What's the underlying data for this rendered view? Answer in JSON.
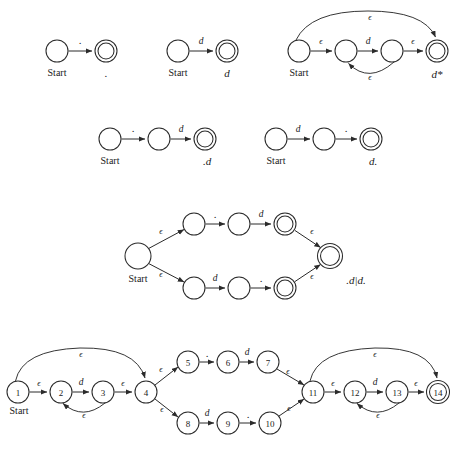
{
  "figure": {
    "start_label": "Start",
    "epsilon": "ϵ",
    "symbols": {
      "dot": ".",
      "digit": "d"
    }
  },
  "diagrams": [
    {
      "id": "nfa-dot",
      "caption": ".",
      "start_label": "Start",
      "states": [
        {
          "name": "q0",
          "accepting": false,
          "label": ""
        },
        {
          "name": "q1",
          "accepting": true,
          "label": ""
        }
      ],
      "transitions": [
        {
          "from": "q0",
          "to": "q1",
          "label": "."
        }
      ]
    },
    {
      "id": "nfa-digit",
      "caption": "d",
      "start_label": "Start",
      "states": [
        {
          "name": "q0",
          "accepting": false,
          "label": ""
        },
        {
          "name": "q1",
          "accepting": true,
          "label": ""
        }
      ],
      "transitions": [
        {
          "from": "q0",
          "to": "q1",
          "label": "d"
        }
      ]
    },
    {
      "id": "nfa-digit-star",
      "caption": "d*",
      "start_label": "Start",
      "states": [
        {
          "name": "q0",
          "accepting": false,
          "label": ""
        },
        {
          "name": "q1",
          "accepting": false,
          "label": ""
        },
        {
          "name": "q2",
          "accepting": false,
          "label": ""
        },
        {
          "name": "q3",
          "accepting": true,
          "label": ""
        }
      ],
      "transitions": [
        {
          "from": "q0",
          "to": "q1",
          "label": "ϵ"
        },
        {
          "from": "q1",
          "to": "q2",
          "label": "d"
        },
        {
          "from": "q2",
          "to": "q3",
          "label": "ϵ"
        },
        {
          "from": "q2",
          "to": "q1",
          "label": "ϵ"
        },
        {
          "from": "q0",
          "to": "q3",
          "label": "ϵ"
        }
      ]
    },
    {
      "id": "nfa-dot-digit",
      "caption": ".d",
      "start_label": "Start",
      "states": [
        {
          "name": "q0",
          "accepting": false,
          "label": ""
        },
        {
          "name": "q1",
          "accepting": false,
          "label": ""
        },
        {
          "name": "q2",
          "accepting": true,
          "label": ""
        }
      ],
      "transitions": [
        {
          "from": "q0",
          "to": "q1",
          "label": "."
        },
        {
          "from": "q1",
          "to": "q2",
          "label": "d"
        }
      ]
    },
    {
      "id": "nfa-digit-dot",
      "caption": "d.",
      "start_label": "Start",
      "states": [
        {
          "name": "q0",
          "accepting": false,
          "label": ""
        },
        {
          "name": "q1",
          "accepting": false,
          "label": ""
        },
        {
          "name": "q2",
          "accepting": true,
          "label": ""
        }
      ],
      "transitions": [
        {
          "from": "q0",
          "to": "q1",
          "label": "d"
        },
        {
          "from": "q1",
          "to": "q2",
          "label": "."
        }
      ]
    },
    {
      "id": "nfa-union",
      "caption": ".d|d.",
      "start_label": "Start",
      "states": [
        {
          "name": "s",
          "accepting": false,
          "label": ""
        },
        {
          "name": "a1",
          "accepting": false,
          "label": ""
        },
        {
          "name": "a2",
          "accepting": false,
          "label": ""
        },
        {
          "name": "a3",
          "accepting": true,
          "label": ""
        },
        {
          "name": "b1",
          "accepting": false,
          "label": ""
        },
        {
          "name": "b2",
          "accepting": false,
          "label": ""
        },
        {
          "name": "b3",
          "accepting": true,
          "label": ""
        },
        {
          "name": "f",
          "accepting": true,
          "label": ""
        }
      ],
      "transitions": [
        {
          "from": "s",
          "to": "a1",
          "label": "ϵ"
        },
        {
          "from": "a1",
          "to": "a2",
          "label": "."
        },
        {
          "from": "a2",
          "to": "a3",
          "label": "d"
        },
        {
          "from": "a3",
          "to": "f",
          "label": "ϵ"
        },
        {
          "from": "s",
          "to": "b1",
          "label": "ϵ"
        },
        {
          "from": "b1",
          "to": "b2",
          "label": "d"
        },
        {
          "from": "b2",
          "to": "b3",
          "label": "."
        },
        {
          "from": "b3",
          "to": "f",
          "label": "ϵ"
        }
      ]
    },
    {
      "id": "nfa-numbered",
      "caption": "",
      "start_label": "Start",
      "states": [
        {
          "name": "1",
          "accepting": false,
          "label": "1"
        },
        {
          "name": "2",
          "accepting": false,
          "label": "2"
        },
        {
          "name": "3",
          "accepting": false,
          "label": "3"
        },
        {
          "name": "4",
          "accepting": false,
          "label": "4"
        },
        {
          "name": "5",
          "accepting": false,
          "label": "5"
        },
        {
          "name": "6",
          "accepting": false,
          "label": "6"
        },
        {
          "name": "7",
          "accepting": false,
          "label": "7"
        },
        {
          "name": "8",
          "accepting": false,
          "label": "8"
        },
        {
          "name": "9",
          "accepting": false,
          "label": "9"
        },
        {
          "name": "10",
          "accepting": false,
          "label": "10"
        },
        {
          "name": "11",
          "accepting": false,
          "label": "11"
        },
        {
          "name": "12",
          "accepting": false,
          "label": "12"
        },
        {
          "name": "13",
          "accepting": false,
          "label": "13"
        },
        {
          "name": "14",
          "accepting": true,
          "label": "14"
        }
      ],
      "transitions": [
        {
          "from": "1",
          "to": "2",
          "label": "ϵ"
        },
        {
          "from": "2",
          "to": "3",
          "label": "d"
        },
        {
          "from": "3",
          "to": "4",
          "label": "ϵ"
        },
        {
          "from": "3",
          "to": "2",
          "label": "ϵ"
        },
        {
          "from": "1",
          "to": "4",
          "label": "ϵ"
        },
        {
          "from": "4",
          "to": "5",
          "label": "ϵ"
        },
        {
          "from": "5",
          "to": "6",
          "label": "."
        },
        {
          "from": "6",
          "to": "7",
          "label": "d"
        },
        {
          "from": "7",
          "to": "11",
          "label": "ϵ"
        },
        {
          "from": "4",
          "to": "8",
          "label": "ϵ"
        },
        {
          "from": "8",
          "to": "9",
          "label": "d"
        },
        {
          "from": "9",
          "to": "10",
          "label": "."
        },
        {
          "from": "10",
          "to": "11",
          "label": "ϵ"
        },
        {
          "from": "11",
          "to": "12",
          "label": "ϵ"
        },
        {
          "from": "12",
          "to": "13",
          "label": "d"
        },
        {
          "from": "13",
          "to": "14",
          "label": "ϵ"
        },
        {
          "from": "13",
          "to": "12",
          "label": "ϵ"
        },
        {
          "from": "11",
          "to": "14",
          "label": "ϵ"
        }
      ]
    }
  ],
  "labels": {
    "start": "Start",
    "eps": "ϵ",
    "d": "d",
    "dot": ".",
    "cap_dot": ".",
    "cap_d": "d",
    "cap_dstar": "d*",
    "cap_dotd": ".d",
    "cap_ddot": "d.",
    "cap_union": ".d|d.",
    "n1": "1",
    "n2": "2",
    "n3": "3",
    "n4": "4",
    "n5": "5",
    "n6": "6",
    "n7": "7",
    "n8": "8",
    "n9": "9",
    "n10": "10",
    "n11": "11",
    "n12": "12",
    "n13": "13",
    "n14": "14"
  },
  "colors": {
    "background": "#ffffff",
    "stroke": "#2b2b2b",
    "text": "#1a1a1a"
  }
}
